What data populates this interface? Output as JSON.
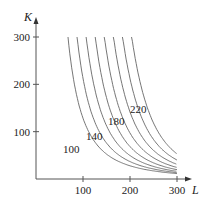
{
  "chart_data": {
    "type": "line",
    "title": "",
    "xlabel": "L",
    "ylabel": "K",
    "xlim": [
      0,
      300
    ],
    "ylim": [
      0,
      300
    ],
    "xticks": [
      100,
      200,
      300
    ],
    "yticks": [
      100,
      200,
      300
    ],
    "grid": false,
    "legend": "none",
    "series": [
      {
        "name": "100",
        "level": 100,
        "labeled": true
      },
      {
        "name": "120",
        "level": 120,
        "labeled": false
      },
      {
        "name": "140",
        "level": 140,
        "labeled": true
      },
      {
        "name": "160",
        "level": 160,
        "labeled": false
      },
      {
        "name": "180",
        "level": 180,
        "labeled": true
      },
      {
        "name": "200",
        "level": 200,
        "labeled": false
      },
      {
        "name": "220",
        "level": 220,
        "labeled": true
      },
      {
        "name": "240",
        "level": 240,
        "labeled": false
      }
    ],
    "annotations": [
      {
        "text": "100",
        "x": 82,
        "y": 88
      },
      {
        "text": "140",
        "x": 128,
        "y": 120
      },
      {
        "text": "180",
        "x": 170,
        "y": 155
      },
      {
        "text": "220",
        "x": 205,
        "y": 190
      }
    ]
  },
  "axes": {
    "x_label": "L",
    "y_label": "K",
    "x_ticks": [
      "100",
      "200",
      "300"
    ],
    "y_ticks": [
      "100",
      "200",
      "300"
    ]
  },
  "colors": {
    "axis": "#555555",
    "curve": "#666666",
    "text": "#222222"
  }
}
